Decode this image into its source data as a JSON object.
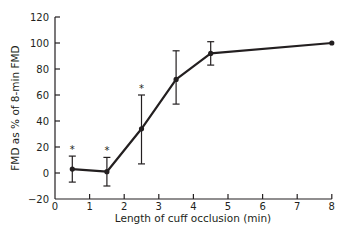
{
  "chart_data": {
    "type": "line",
    "title": "",
    "xlabel": "Length of cuff occlusion (min)",
    "ylabel": "FMD as % of 8-min FMD",
    "xlim": [
      0,
      8
    ],
    "ylim": [
      -20,
      120
    ],
    "x_ticks": [
      0,
      1,
      2,
      3,
      4,
      5,
      6,
      7,
      8
    ],
    "y_ticks": [
      -20,
      0,
      20,
      40,
      60,
      80,
      100,
      120
    ],
    "grid": false,
    "legend": null,
    "series": [
      {
        "name": "FMD",
        "x": [
          0.5,
          1.5,
          2.5,
          3.5,
          4.5,
          8
        ],
        "values": [
          3,
          1,
          34,
          72,
          92,
          100
        ],
        "error_upper": [
          13,
          12,
          60,
          94,
          101,
          null
        ],
        "error_lower": [
          -7,
          -10,
          7,
          53,
          83,
          null
        ],
        "significance": [
          "*",
          "*",
          "*",
          "",
          "",
          ""
        ]
      }
    ]
  },
  "colors": {
    "line": "#231f20",
    "axis": "#231f20"
  }
}
